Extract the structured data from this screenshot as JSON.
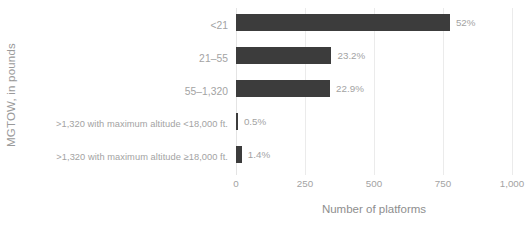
{
  "chart_data": {
    "type": "bar",
    "orientation": "horizontal",
    "title": "",
    "xlabel": "Number of platforms",
    "ylabel": "MGTOW, in pounds",
    "categories": [
      "<21",
      "21–55",
      "55–1,320",
      ">1,320 with maximum altitude <18,000 ft.",
      ">1,320 with maximum altitude ≥18,000 ft."
    ],
    "values": [
      775,
      346,
      341,
      7,
      21
    ],
    "data_labels": [
      "52%",
      "23.2%",
      "22.9%",
      "0.5%",
      "1.4%"
    ],
    "xlim": [
      0,
      1000
    ],
    "xticks": [
      0,
      250,
      500,
      750,
      1000
    ],
    "xtick_labels": [
      "0",
      "250",
      "500",
      "750",
      "1,000"
    ],
    "grid": true,
    "legend": "none",
    "bar_color": "#3c3c3c",
    "gridline_color": "#ebebeb",
    "label_color": "#a3a3a3",
    "axis_title_color": "#8e8e8e",
    "background_color": "#ffffff"
  }
}
